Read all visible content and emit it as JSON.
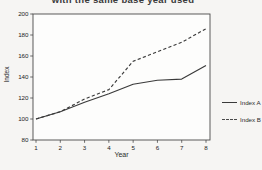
{
  "page": {
    "title_fragment": "with the same base year used"
  },
  "chart_data": {
    "type": "line",
    "title": "with the same base year used",
    "xlabel": "Year",
    "ylabel": "Index",
    "x": [
      1,
      2,
      3,
      4,
      5,
      6,
      7,
      8
    ],
    "series": [
      {
        "name": "Index A",
        "style": "solid",
        "values": [
          100,
          107,
          116,
          124,
          133,
          137,
          138,
          151
        ]
      },
      {
        "name": "Index B",
        "style": "dashed",
        "values": [
          100,
          107,
          119,
          128,
          155,
          164,
          173,
          186
        ]
      }
    ],
    "ylim": [
      80,
      200
    ],
    "yticks": [
      200,
      180,
      160,
      140,
      120,
      100,
      80
    ],
    "xticks": [
      1,
      2,
      3,
      4,
      5,
      6,
      7,
      8
    ],
    "grid": false,
    "legend_position": "right-outside",
    "line_color": "#3a3a3a",
    "plot_background": "#fdfdfc",
    "frame_color": "#4a4a4a"
  },
  "legend": {
    "items": [
      {
        "label": "Index A"
      },
      {
        "label": "Index B"
      }
    ]
  }
}
